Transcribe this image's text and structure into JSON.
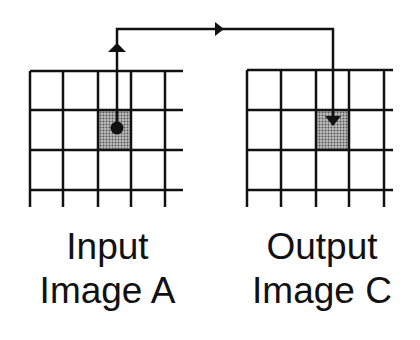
{
  "colors": {
    "line": "#111111",
    "cell_fill": "#8a8a8a",
    "background": "#ffffff"
  },
  "input_image": {
    "label_line1": "Input",
    "label_line2": "Image A",
    "grid_columns": 5,
    "grid_rows": 4,
    "highlighted_cell": {
      "col": 3,
      "row": 2
    },
    "marker": "dot"
  },
  "output_image": {
    "label_line1": "Output",
    "label_line2": "Image C",
    "grid_columns": 5,
    "grid_rows": 4,
    "highlighted_cell": {
      "col": 3,
      "row": 2
    },
    "marker": "arrowhead-down"
  },
  "connector": {
    "from": "Input Image A",
    "to": "Output Image C",
    "arrowheads": [
      "up",
      "right",
      "down"
    ]
  }
}
